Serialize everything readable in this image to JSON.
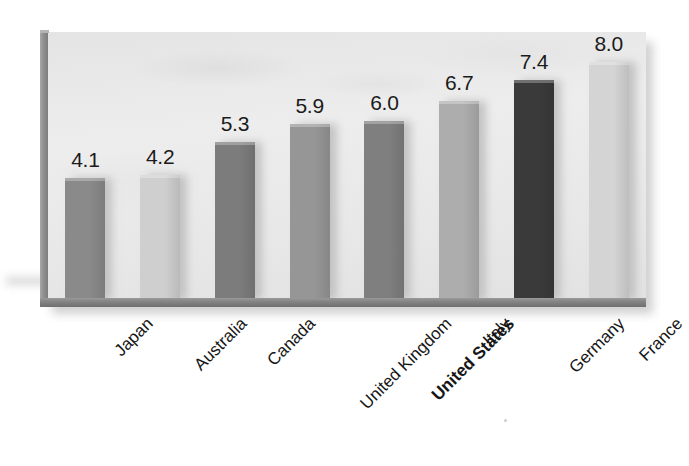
{
  "chart_data": {
    "type": "bar",
    "title": "",
    "subtitle": "",
    "xlabel": "",
    "ylabel": "",
    "categories": [
      "Japan",
      "Australia",
      "Canada",
      "United Kingdom",
      "United States",
      "Italy",
      "Germany",
      "France"
    ],
    "values": [
      4.1,
      4.2,
      5.3,
      5.9,
      6.0,
      6.7,
      7.4,
      8.0
    ],
    "value_labels": [
      "4.1",
      "4.2",
      "5.3",
      "5.9",
      "6.0",
      "6.7",
      "7.4",
      "8.0"
    ],
    "bar_colors": [
      "#8a8a8a",
      "#cfcfcf",
      "#7c7c7c",
      "#969696",
      "#7f7f7f",
      "#adadad",
      "#3a3a3a",
      "#d4d4d4"
    ],
    "highlighted_category": "United States",
    "ylim": [
      0,
      9.0
    ],
    "grid": false,
    "legend": false,
    "axis_ticks_visible": false,
    "label_rotation_degrees": -45,
    "plot_background_color": "#eaeaea",
    "axis_color": "#7d7d7d",
    "text_color": "#161616"
  },
  "figure": {
    "background_color": "#ffffff",
    "has_drop_shadow": true
  }
}
